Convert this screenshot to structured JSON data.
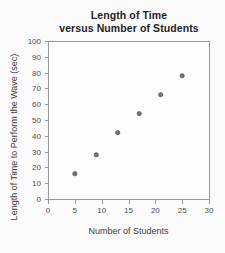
{
  "figure": {
    "title_lines": [
      "Length of Time",
      "versus Number of Students"
    ]
  },
  "chart_data": {
    "type": "scatter",
    "title": "Length of Time versus Number of Students",
    "xlabel": "Number of Students",
    "ylabel": "Length of Time to Perform the Wave (sec)",
    "x": [
      5,
      9,
      13,
      17,
      21,
      25
    ],
    "y": [
      16,
      28,
      42,
      54,
      66,
      78
    ],
    "points": [
      {
        "students": 5,
        "time_sec": 16
      },
      {
        "students": 9,
        "time_sec": 28
      },
      {
        "students": 13,
        "time_sec": 42
      },
      {
        "students": 17,
        "time_sec": 54
      },
      {
        "students": 21,
        "time_sec": 66
      },
      {
        "students": 25,
        "time_sec": 78
      }
    ],
    "xlim": [
      0,
      30
    ],
    "ylim": [
      0,
      100
    ],
    "xticks": [
      0,
      5,
      10,
      15,
      20,
      25,
      30
    ],
    "yticks": [
      0,
      10,
      20,
      30,
      40,
      50,
      60,
      70,
      80,
      90,
      100
    ],
    "grid": false,
    "legend": false,
    "colors": {
      "point_fill": "#757575",
      "point_stroke": "#555555",
      "axis": "#9a9a9a",
      "tick_text": "#4f4f4f",
      "title_text": "#1f1f1f",
      "label_text": "#3d3d3d",
      "plot_bg": "#fdfdfd",
      "page_bg": "#fafafa"
    }
  }
}
